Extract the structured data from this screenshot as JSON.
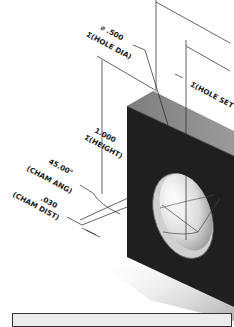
{
  "drawing": {
    "annotations": {
      "hole_dia_value": "⌀ .500",
      "hole_dia_label": "Σ(HOLE DIA)",
      "hole_set_label": "Σ(HOLE SET",
      "height_value": "1.000",
      "height_label": "Σ(HEIGHT)",
      "cham_ang_value": "45.00°",
      "cham_ang_label": "(CHAM ANG)",
      "cham_dist_value": ".030",
      "cham_dist_label": "(CHAM DIST)"
    },
    "colors": {
      "top_face": "#8a8a8a",
      "front_face": "#1e1e1e",
      "line": "#222222"
    }
  },
  "bottom_panel": {
    "label": ""
  }
}
